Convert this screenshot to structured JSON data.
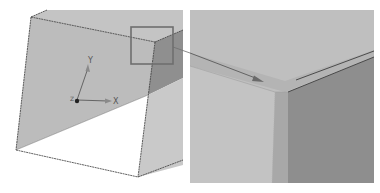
{
  "figure": {
    "left_panel": {
      "view": "3d-model-overview",
      "axes": {
        "x_label": "X",
        "y_label": "Y",
        "z_label": "Z"
      },
      "highlight_box": "detail-region"
    },
    "right_panel": {
      "view": "zoomed-detail"
    }
  },
  "colors": {
    "background": "#ffffff",
    "face_front": "#bdbdbd",
    "face_top": "#c4c4c4",
    "face_side_dark": "#8f8f8f",
    "face_side_light": "#c9c9c9",
    "edge": "#3a3a3a",
    "highlight_box": "#6e6e6e",
    "zoom_top": "#bfbfbf",
    "zoom_band": "#b6b6b6",
    "zoom_left_face": "#c2c2c2",
    "zoom_strip": "#a9a9a9",
    "zoom_right_face": "#8e8e8e"
  }
}
